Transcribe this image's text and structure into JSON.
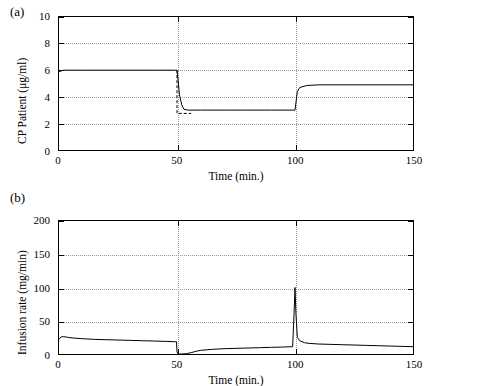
{
  "figure": {
    "panel_a_label": "(a)",
    "panel_b_label": "(b)"
  },
  "chart_data": [
    {
      "type": "line",
      "panel": "(a)",
      "title": "",
      "xlabel": "Time (min.)",
      "ylabel": "CP Patient (μg/ml)",
      "xlim": [
        0,
        150
      ],
      "ylim": [
        0,
        10
      ],
      "xticks": [
        0,
        50,
        100,
        150
      ],
      "yticks": [
        0,
        2,
        4,
        6,
        8,
        10
      ],
      "grid": true,
      "series": [
        {
          "name": "CP patient concentration",
          "x": [
            0,
            2,
            5,
            10,
            20,
            30,
            40,
            49,
            50,
            50.5,
            51,
            52,
            53,
            55,
            60,
            70,
            80,
            90,
            99,
            100,
            100.5,
            101,
            102,
            105,
            110,
            120,
            130,
            140,
            150
          ],
          "y": [
            5.9,
            6.0,
            6.0,
            6.0,
            6.0,
            6.0,
            6.0,
            6.0,
            6.0,
            5.2,
            4.2,
            3.4,
            3.05,
            3.0,
            3.0,
            3.0,
            3.0,
            3.0,
            3.0,
            3.0,
            3.7,
            4.4,
            4.7,
            4.85,
            4.9,
            4.9,
            4.9,
            4.9,
            4.9
          ]
        }
      ],
      "annotations": [
        {
          "text": "dashed reference overshoot near t=50",
          "x": 50,
          "y": 2.8
        }
      ]
    },
    {
      "type": "line",
      "panel": "(b)",
      "title": "",
      "xlabel": "Time (min.)",
      "ylabel": "Infusion rate (mg/min)",
      "xlim": [
        0,
        150
      ],
      "ylim": [
        0,
        200
      ],
      "xticks": [
        0,
        50,
        100,
        150
      ],
      "yticks": [
        0,
        50,
        100,
        150,
        200
      ],
      "grid": true,
      "series": [
        {
          "name": "Infusion rate",
          "x": [
            0,
            1,
            2,
            4,
            6,
            10,
            15,
            20,
            25,
            30,
            35,
            40,
            45,
            49,
            49.8,
            50,
            50.5,
            51,
            52,
            54,
            56,
            58,
            60,
            65,
            70,
            75,
            80,
            85,
            90,
            95,
            99,
            99.6,
            100,
            100.4,
            101,
            102,
            104,
            106,
            110,
            115,
            120,
            125,
            130,
            135,
            140,
            145,
            150
          ],
          "y": [
            22,
            26,
            26,
            25,
            24,
            23,
            22,
            21.5,
            21,
            20.5,
            20,
            19.5,
            19,
            18.5,
            18.5,
            3,
            0,
            0,
            0,
            0.5,
            2,
            4,
            5.5,
            7,
            8,
            8.5,
            9,
            9.5,
            10,
            10.5,
            11,
            60,
            100,
            60,
            25,
            20,
            17,
            16,
            15,
            14.5,
            14,
            13.5,
            13,
            12.5,
            12,
            11.5,
            11
          ]
        }
      ]
    }
  ]
}
